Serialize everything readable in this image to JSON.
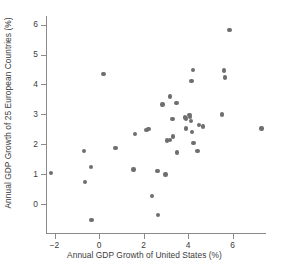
{
  "chart_data": {
    "type": "scatter",
    "title": "",
    "xlabel": "Annual GDP Growth of United States (%)",
    "ylabel": "Annual GDP Growth of 25 European Countries (%)",
    "xlim": [
      -2.9,
      7.9
    ],
    "ylim": [
      -0.9,
      6.4
    ],
    "xticks": [
      -2,
      0,
      2,
      4,
      6
    ],
    "xtick_labels": [
      "−2",
      "0",
      "2",
      "4",
      "6"
    ],
    "yticks": [
      0,
      1,
      2,
      3,
      4,
      5,
      6
    ],
    "ytick_labels": [
      "0",
      "1",
      "2",
      "3",
      "4",
      "5",
      "6"
    ],
    "grid": false,
    "legend": "none",
    "marker_color": "#6e6e6e",
    "axis_color": "#8a8a8a",
    "background": "#ffffff",
    "n_points": 40,
    "points": [
      {
        "x": -2.15,
        "y": 1.03
      },
      {
        "x": -0.68,
        "y": 1.78
      },
      {
        "x": -0.37,
        "y": 1.23
      },
      {
        "x": -0.62,
        "y": 0.74
      },
      {
        "x": -0.33,
        "y": -0.53
      },
      {
        "x": 0.21,
        "y": 4.35
      },
      {
        "x": 0.75,
        "y": 1.87
      },
      {
        "x": 1.63,
        "y": 2.34
      },
      {
        "x": 1.55,
        "y": 1.16
      },
      {
        "x": 2.22,
        "y": 2.51
      },
      {
        "x": 2.13,
        "y": 2.47
      },
      {
        "x": 2.39,
        "y": 0.27
      },
      {
        "x": 2.63,
        "y": 1.1
      },
      {
        "x": 2.65,
        "y": -0.36
      },
      {
        "x": 2.85,
        "y": 3.33
      },
      {
        "x": 2.99,
        "y": 0.99
      },
      {
        "x": 3.05,
        "y": 2.13
      },
      {
        "x": 3.18,
        "y": 3.6
      },
      {
        "x": 3.2,
        "y": 2.15
      },
      {
        "x": 3.3,
        "y": 2.84
      },
      {
        "x": 3.32,
        "y": 2.26
      },
      {
        "x": 3.48,
        "y": 3.37
      },
      {
        "x": 3.5,
        "y": 1.72
      },
      {
        "x": 3.86,
        "y": 2.89
      },
      {
        "x": 3.9,
        "y": 2.86
      },
      {
        "x": 3.92,
        "y": 2.53
      },
      {
        "x": 4.07,
        "y": 2.97
      },
      {
        "x": 4.08,
        "y": 2.91
      },
      {
        "x": 4.13,
        "y": 2.78
      },
      {
        "x": 4.16,
        "y": 4.11
      },
      {
        "x": 4.18,
        "y": 2.41
      },
      {
        "x": 4.23,
        "y": 4.49
      },
      {
        "x": 4.25,
        "y": 2.03
      },
      {
        "x": 4.43,
        "y": 1.78
      },
      {
        "x": 4.49,
        "y": 2.65
      },
      {
        "x": 4.67,
        "y": 2.59
      },
      {
        "x": 5.54,
        "y": 2.99
      },
      {
        "x": 5.63,
        "y": 4.47
      },
      {
        "x": 5.66,
        "y": 4.23
      },
      {
        "x": 5.87,
        "y": 5.82
      },
      {
        "x": 7.31,
        "y": 2.52
      }
    ]
  }
}
